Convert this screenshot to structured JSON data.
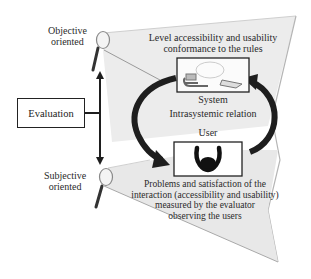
{
  "diagram": {
    "left_labels": {
      "objective": "Objective\noriented",
      "objective_line1": "Objective",
      "objective_line2": "oriented",
      "subjective_line1": "Subjective",
      "subjective_line2": "oriented",
      "evaluation": "Evaluation"
    },
    "top_cone": {
      "line1": "Level accessibility and usability",
      "line2": "conformance to the rules",
      "box_icon": "computer-system-icon"
    },
    "center": {
      "system": "System",
      "relation": "Intrasystemic relation",
      "user": "User"
    },
    "bottom_cone": {
      "box_icon": "user-headphones-icon",
      "line1": "Problems and satisfaction of the",
      "line2": "interaction (accessibility and usability)",
      "line3": "measured by the evaluator",
      "line4": "observing the users"
    },
    "colors": {
      "cone_fill": "#e9e9e9",
      "cone_edge": "#b5b5b5",
      "arrow": "#1e1e1e",
      "text": "#2a2a2a"
    }
  }
}
